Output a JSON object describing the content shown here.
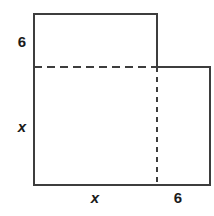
{
  "figure": {
    "kind": "geometry-diagram",
    "stroke_color": "#3d3d3d",
    "dashed_color": "#3d3d3d",
    "background_color": "#ffffff",
    "stroke_width": 2,
    "outline_points": "34,14 157,14 157,67 210,67 210,185 34,185",
    "dashed_horizontal": {
      "x1": 34,
      "y1": 67,
      "x2": 157,
      "y2": 67
    },
    "dashed_vertical": {
      "x1": 157,
      "y1": 67,
      "x2": 157,
      "y2": 185
    },
    "labels": {
      "left_top": "6",
      "left_side": "x",
      "bottom_left": "x",
      "bottom_right": "6"
    }
  }
}
